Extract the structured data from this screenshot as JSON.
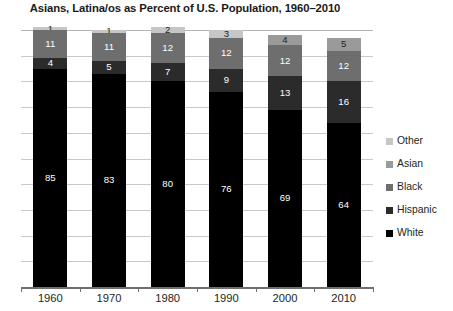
{
  "chart_data": {
    "type": "bar",
    "subtype": "stacked-bar",
    "title": "Asians, Latina/os as Percent of U.S. Population, 1960–2010",
    "xlabel": "",
    "ylabel": "",
    "ylim": [
      0,
      100
    ],
    "grid": true,
    "gridline_interval": 10,
    "legend_position": "right",
    "stack_order_bottom_to_top": [
      "White",
      "Hispanic",
      "Black",
      "Asian",
      "Other"
    ],
    "categories": [
      "1960",
      "1970",
      "1980",
      "1990",
      "2000",
      "2010"
    ],
    "series": [
      {
        "name": "White",
        "color": "#000000",
        "values": [
          85,
          83,
          80,
          76,
          69,
          64
        ],
        "labels": [
          "85",
          "83",
          "80",
          "76",
          "69",
          "64"
        ]
      },
      {
        "name": "Hispanic",
        "color": "#2b2b2b",
        "values": [
          4,
          5,
          7,
          9,
          13,
          16
        ],
        "labels": [
          "4",
          "5",
          "7",
          "9",
          "13",
          "16"
        ]
      },
      {
        "name": "Black",
        "color": "#6e6e6e",
        "values": [
          11,
          11,
          12,
          12,
          12,
          12
        ],
        "labels": [
          "11",
          "11",
          "12",
          "12",
          "12",
          "12"
        ]
      },
      {
        "name": "Asian",
        "color": "#9a9a9a",
        "values": [
          0,
          0,
          0,
          0,
          4,
          5
        ],
        "labels": [
          "",
          "",
          "",
          "",
          "4",
          "5"
        ]
      },
      {
        "name": "Other",
        "color": "#c6c6c6",
        "values": [
          1,
          1,
          2,
          3,
          0,
          0
        ],
        "labels": [
          "1",
          "1",
          "2",
          "3",
          "",
          ""
        ]
      }
    ],
    "legend_entries": [
      {
        "label": "Other",
        "color": "#c6c6c6"
      },
      {
        "label": "Asian",
        "color": "#9a9a9a"
      },
      {
        "label": "Black",
        "color": "#6e6e6e"
      },
      {
        "label": "Hispanic",
        "color": "#2b2b2b"
      },
      {
        "label": "White",
        "color": "#000000"
      }
    ],
    "xtick_labels": [
      "1960",
      "1970",
      "1980",
      "1990",
      "2000",
      "2010"
    ],
    "ytick_labels": []
  }
}
